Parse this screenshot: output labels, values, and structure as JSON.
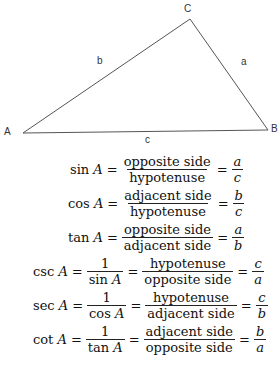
{
  "triangle": {
    "vertices": {
      "A": {
        "label": "A",
        "x": 23,
        "y": 133
      },
      "B": {
        "label": "B",
        "x": 268,
        "y": 130
      },
      "C": {
        "label": "C",
        "x": 190,
        "y": 19
      }
    },
    "sides": {
      "a": {
        "label": "a"
      },
      "b": {
        "label": "b"
      },
      "c": {
        "label": "c"
      }
    },
    "stroke_color": "#555555"
  },
  "formulas": [
    {
      "fn": "sin",
      "var": "A",
      "ratio": {
        "num": "opposite side",
        "den": "hypotenuse"
      },
      "result": {
        "num": "a",
        "den": "c"
      }
    },
    {
      "fn": "cos",
      "var": "A",
      "ratio": {
        "num": "adjacent side",
        "den": "hypotenuse"
      },
      "result": {
        "num": "b",
        "den": "c"
      }
    },
    {
      "fn": "tan",
      "var": "A",
      "ratio": {
        "num": "opposite side",
        "den": "adjacent side"
      },
      "result": {
        "num": "a",
        "den": "b"
      }
    },
    {
      "fn": "csc",
      "var": "A",
      "recip": {
        "num": "1",
        "den_fn": "sin",
        "den_var": "A"
      },
      "ratio": {
        "num": "hypotenuse",
        "den": "opposite side"
      },
      "result": {
        "num": "c",
        "den": "a"
      }
    },
    {
      "fn": "sec",
      "var": "A",
      "recip": {
        "num": "1",
        "den_fn": "cos",
        "den_var": "A"
      },
      "ratio": {
        "num": "hypotenuse",
        "den": "adjacent side"
      },
      "result": {
        "num": "c",
        "den": "b"
      }
    },
    {
      "fn": "cot",
      "var": "A",
      "recip": {
        "num": "1",
        "den_fn": "tan",
        "den_var": "A"
      },
      "ratio": {
        "num": "adjacent side",
        "den": "opposite side"
      },
      "result": {
        "num": "b",
        "den": "a"
      }
    }
  ],
  "symbols": {
    "equals": "="
  }
}
